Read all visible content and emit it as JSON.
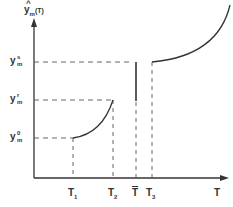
{
  "diagram": {
    "y_axis_label": {
      "hat": "^",
      "base": "y",
      "sub": "m",
      "arg": "(T)"
    },
    "x_axis_label": "T",
    "y_ticks": [
      {
        "base": "y",
        "sup": "s",
        "sub": "m",
        "name": "y-m-s"
      },
      {
        "base": "y",
        "sup": "r",
        "sub": "m",
        "name": "y-m-r"
      },
      {
        "base": "y",
        "sup": "0",
        "sub": "m",
        "name": "y-m-0"
      }
    ],
    "x_ticks": [
      {
        "base": "T",
        "sub": "1"
      },
      {
        "base": "T",
        "sub": "2"
      },
      {
        "base": "T",
        "bar": true,
        "sub": ""
      },
      {
        "base": "T",
        "sub": "3"
      }
    ],
    "colors": {
      "line": "#333333",
      "dash": "#555555"
    }
  }
}
